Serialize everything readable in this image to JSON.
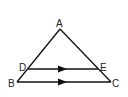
{
  "diagram": {
    "type": "triangle-with-parallel-segment",
    "points": {
      "A": "A",
      "B": "B",
      "C": "C",
      "D": "D",
      "E": "E"
    },
    "segments": [
      "AB",
      "AC",
      "BC",
      "DE"
    ],
    "parallel_marks": [
      "DE",
      "BC"
    ],
    "line_color": "#111111"
  }
}
